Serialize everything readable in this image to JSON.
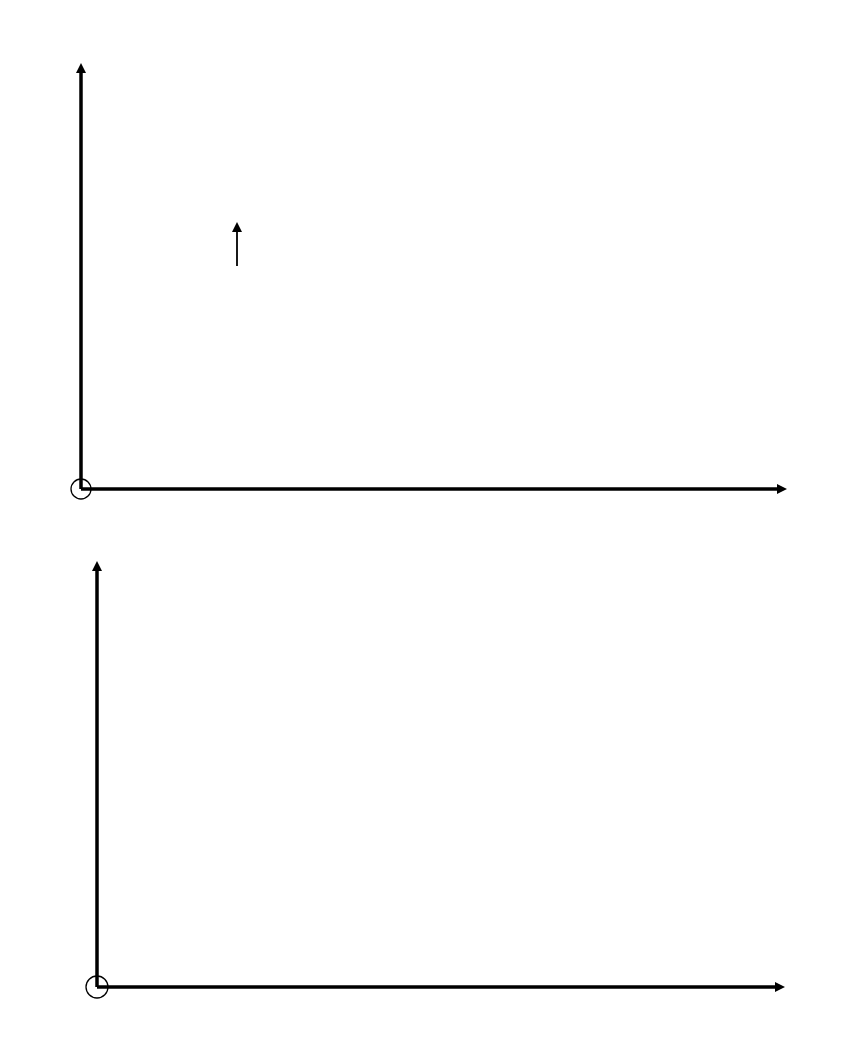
{
  "chart_data": [
    {
      "type": "line",
      "title": "",
      "xlabel": "H / Am^-1",
      "ylabel": "B / T",
      "xlim": [
        0,
        1650
      ],
      "ylim": [
        0,
        2.2
      ],
      "xticks": [
        400,
        800,
        1200,
        1600
      ],
      "xtick_labels": [
        "400",
        "800",
        "1200",
        "1600"
      ],
      "yticks": [
        0.5,
        1.0,
        1.5,
        2.0
      ],
      "ytick_labels": [
        "0.5",
        "1.0",
        "1.5",
        "2.0"
      ],
      "grid": false,
      "legend": null,
      "series": [
        {
          "name": "B-H magnetization curve (measured points)",
          "style": "solid line with dot markers",
          "x": [
            0,
            40,
            80,
            160,
            240,
            320,
            480,
            800,
            1200,
            1600
          ],
          "y": [
            0,
            0.2,
            0.4,
            0.8,
            1.13,
            1.33,
            1.6,
            1.87,
            1.95,
            2.0
          ]
        },
        {
          "name": "Load line",
          "style": "dash-dot line",
          "x": [
            0,
            1520
          ],
          "y": [
            1.9,
            0
          ]
        }
      ],
      "annotations": [
        {
          "text": "(H1, B1)",
          "x": 365,
          "y": 1.44,
          "arrow": true
        }
      ],
      "origin_marker": "circle"
    },
    {
      "type": "line",
      "title": "",
      "xlabel": "H / Am^-1",
      "ylabel": "μr",
      "xlim": [
        0,
        1050
      ],
      "ylim": [
        0,
        4900
      ],
      "xticks": [
        250,
        500,
        750,
        1000
      ],
      "xtick_labels": [
        "250",
        "500",
        "750",
        "1000"
      ],
      "yticks": [
        1125,
        2250,
        3375,
        4500
      ],
      "ytick_labels": [
        "1125",
        "2250",
        "3375",
        "4500"
      ],
      "grid": false,
      "legend": null,
      "series": [
        {
          "name": "Relative permeability",
          "style": "solid line",
          "x": [
            8,
            12,
            20,
            35,
            56,
            100,
            150,
            200,
            300,
            400,
            500,
            600,
            700,
            800,
            900,
            985
          ],
          "y": [
            2400,
            3300,
            3950,
            4250,
            4330,
            4230,
            4020,
            3800,
            3380,
            2990,
            2650,
            2340,
            2080,
            1860,
            1690,
            1550
          ]
        }
      ],
      "origin_marker": "circle"
    }
  ],
  "labels": {
    "top_y_axis": {
      "var": "B",
      "unit": "/ T"
    },
    "top_x_axis": {
      "var": "H",
      "unit": "/ Am",
      "exp": "−1"
    },
    "bottom_y_axis": {
      "var": "μ",
      "sub": "r"
    },
    "bottom_x_axis": {
      "var": "H",
      "unit": "/ Am",
      "exp": "−1"
    },
    "intersection": "(H₁, B₁)"
  },
  "colors": {
    "ink": "#000000",
    "tick_text": "#555555"
  }
}
